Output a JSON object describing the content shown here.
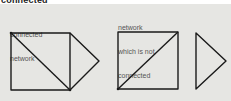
{
  "heading": "connected",
  "left": {
    "label_line1": "connected",
    "label_line2": "network"
  },
  "right": {
    "label_line1": "network",
    "label_line2": "which is not",
    "label_line3": "connected"
  },
  "colors": {
    "background": "#e6e6e3",
    "line": "#1a1a1a",
    "text": "#555555"
  }
}
